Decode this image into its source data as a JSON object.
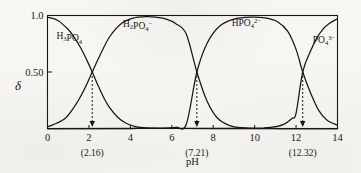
{
  "chart_data": {
    "type": "line",
    "title": "",
    "xlabel": "pH",
    "ylabel": "δ",
    "xlim": [
      0,
      14
    ],
    "ylim": [
      0,
      1.0
    ],
    "grid": false,
    "legend_position": "inline-curve-labels",
    "x_ticks": [
      "0",
      "2",
      "4",
      "6",
      "8",
      "10",
      "12",
      "14"
    ],
    "x_tick_values": [
      0,
      2,
      4,
      6,
      8,
      10,
      12,
      14
    ],
    "y_ticks": [
      "0.50",
      "1.0"
    ],
    "y_tick_values": [
      0.5,
      1.0
    ],
    "annotations": [
      {
        "name": "pka1",
        "label": "(2.16)",
        "x": 2.16,
        "y": 0.5
      },
      {
        "name": "pka2",
        "label": "(7.21)",
        "x": 7.21,
        "y": 0.5
      },
      {
        "name": "pka3",
        "label": "(12.32)",
        "x": 12.32,
        "y": 0.5
      }
    ],
    "series": [
      {
        "name": "H3PO4",
        "label_parts": [
          {
            "t": "H",
            "k": "base"
          },
          {
            "t": "3",
            "k": "sub"
          },
          {
            "t": "PO",
            "k": "base"
          },
          {
            "t": "4",
            "k": "sub"
          }
        ],
        "label_x": 1.05,
        "label_y": 0.79,
        "x": [
          0,
          0.5,
          1.0,
          1.3,
          1.6,
          1.9,
          2.16,
          2.4,
          2.7,
          3.0,
          3.4,
          3.8,
          4.3,
          4.8,
          5.5,
          6.5,
          8.0,
          10.0,
          12.0,
          14.0
        ],
        "y": [
          0.985,
          0.956,
          0.876,
          0.805,
          0.715,
          0.605,
          0.5,
          0.397,
          0.279,
          0.184,
          0.098,
          0.046,
          0.015,
          0.005,
          0.001,
          0.0,
          0.0,
          0.0,
          0.0,
          0.0
        ]
      },
      {
        "name": "H2PO4-",
        "label_parts": [
          {
            "t": "H",
            "k": "base"
          },
          {
            "t": "2",
            "k": "sub"
          },
          {
            "t": "PO",
            "k": "base"
          },
          {
            "t": "4",
            "k": "sub"
          },
          {
            "t": "−",
            "k": "sup"
          }
        ],
        "label_x": 4.35,
        "label_y": 0.9,
        "x": [
          0,
          0.8,
          1.3,
          1.6,
          1.9,
          2.16,
          2.5,
          3.0,
          3.6,
          4.2,
          4.7,
          5.2,
          5.7,
          6.2,
          6.7,
          7.21,
          7.7,
          8.2,
          8.8,
          9.4,
          10.2,
          11.2,
          12.5,
          14.0
        ],
        "y": [
          0.013,
          0.081,
          0.194,
          0.284,
          0.394,
          0.5,
          0.635,
          0.812,
          0.934,
          0.98,
          0.989,
          0.986,
          0.97,
          0.928,
          0.836,
          0.5,
          0.243,
          0.093,
          0.026,
          0.007,
          0.001,
          0.0,
          0.0,
          0.0
        ]
      },
      {
        "name": "HPO4(2-)",
        "label_parts": [
          {
            "t": "HPO",
            "k": "base"
          },
          {
            "t": "4",
            "k": "sub"
          },
          {
            "t": "2−",
            "k": "sup"
          }
        ],
        "label_x": 9.6,
        "label_y": 0.905,
        "x": [
          0,
          4.0,
          5.5,
          6.2,
          6.7,
          7.21,
          7.7,
          8.3,
          9.0,
          9.8,
          10.5,
          11.1,
          11.6,
          12.0,
          12.32,
          12.7,
          13.1,
          13.5,
          14.0
        ],
        "y": [
          0.0,
          0.0,
          0.002,
          0.011,
          0.038,
          0.5,
          0.753,
          0.905,
          0.968,
          0.986,
          0.978,
          0.945,
          0.86,
          0.7,
          0.5,
          0.315,
          0.158,
          0.073,
          0.029
        ]
      },
      {
        "name": "PO4(3-)",
        "label_parts": [
          {
            "t": "PO",
            "k": "base"
          },
          {
            "t": "4",
            "k": "sub"
          },
          {
            "t": "3−",
            "k": "sup"
          }
        ],
        "label_x": 13.35,
        "label_y": 0.76,
        "x": [
          0,
          9.5,
          10.5,
          11.0,
          11.4,
          11.8,
          12.0,
          12.32,
          12.7,
          13.0,
          13.3,
          13.6,
          14.0
        ],
        "y": [
          0.0,
          0.001,
          0.006,
          0.016,
          0.036,
          0.089,
          0.135,
          0.5,
          0.685,
          0.8,
          0.88,
          0.93,
          0.971
        ]
      }
    ]
  }
}
